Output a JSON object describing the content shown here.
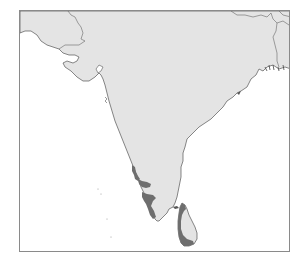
{
  "map": {
    "region": "Indian subcontinent (peninsular India and Sri Lanka)",
    "colors": {
      "sea": "#ffffff",
      "land": "#e4e4e4",
      "coastline": "#555555",
      "border": "#666666",
      "highlight_region": "#6e6e6e",
      "frame": "#8a8a8a"
    },
    "highlighted_areas": [
      {
        "name": "western-ghats-range",
        "label": ""
      },
      {
        "name": "sri-lanka-southwest",
        "label": ""
      }
    ],
    "title": ""
  }
}
